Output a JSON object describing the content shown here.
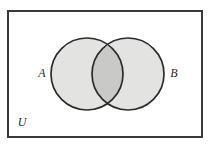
{
  "diagram": {
    "type": "venn-diagram",
    "universe": {
      "label": "U",
      "shape": "rectangle",
      "border_color": "#3a3a3a",
      "fill_color": "#ffffff",
      "label_position": "bottom-left-inside"
    },
    "sets": [
      {
        "id": "A",
        "label": "A",
        "shape": "circle",
        "fill_color": "#e3e3e1",
        "stroke_color": "#2b2b2b",
        "label_position": "left-outside"
      },
      {
        "id": "B",
        "label": "B",
        "shape": "circle",
        "fill_color": "#e3e3e1",
        "stroke_color": "#2b2b2b",
        "label_position": "right-outside"
      }
    ],
    "intersection": {
      "label": "",
      "fill_color": "#c9c9c7",
      "shaded": true
    }
  }
}
